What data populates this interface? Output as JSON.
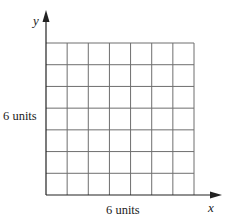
{
  "diagram": {
    "type": "square-grid-on-axes",
    "grid": {
      "columns": 7,
      "rows": 7,
      "origin_px": [
        46,
        195
      ],
      "right_px": 194,
      "top_px": 43,
      "line_color": "#6e6e6e"
    },
    "axes": {
      "x_label": "x",
      "y_label": "y",
      "color": "#222222"
    },
    "dimension_labels": {
      "height": "6 units",
      "width": "6 units"
    }
  }
}
